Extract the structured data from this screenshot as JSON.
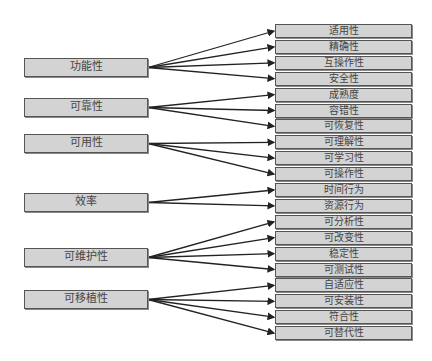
{
  "diagram": {
    "type": "tree",
    "characteristics": [
      {
        "label": "功能性",
        "top": 58,
        "subs": [
          "适用性",
          "精确性",
          "互操作性",
          "安全性"
        ]
      },
      {
        "label": "可靠性",
        "top": 98,
        "subs": [
          "成熟度",
          "容错性",
          "可恢复性"
        ]
      },
      {
        "label": "可用性",
        "top": 134,
        "subs": [
          "可理解性",
          "可学习性",
          "可操作性"
        ]
      },
      {
        "label": "效率",
        "top": 193,
        "subs": [
          "时间行为",
          "资源行为"
        ]
      },
      {
        "label": "可维护性",
        "top": 248,
        "subs": [
          "可分析性",
          "可改变性",
          "稳定性",
          "可测试性"
        ]
      },
      {
        "label": "可移植性",
        "top": 290,
        "subs": [
          "自适应性",
          "可安装性",
          "符合性",
          "可替代性"
        ]
      }
    ],
    "sub_start_y": 24,
    "sub_step": 15.9,
    "colors": {
      "box_fill": "#d3d3d3",
      "box_border": "#555555",
      "line": "#222222",
      "text": "#444444"
    }
  }
}
